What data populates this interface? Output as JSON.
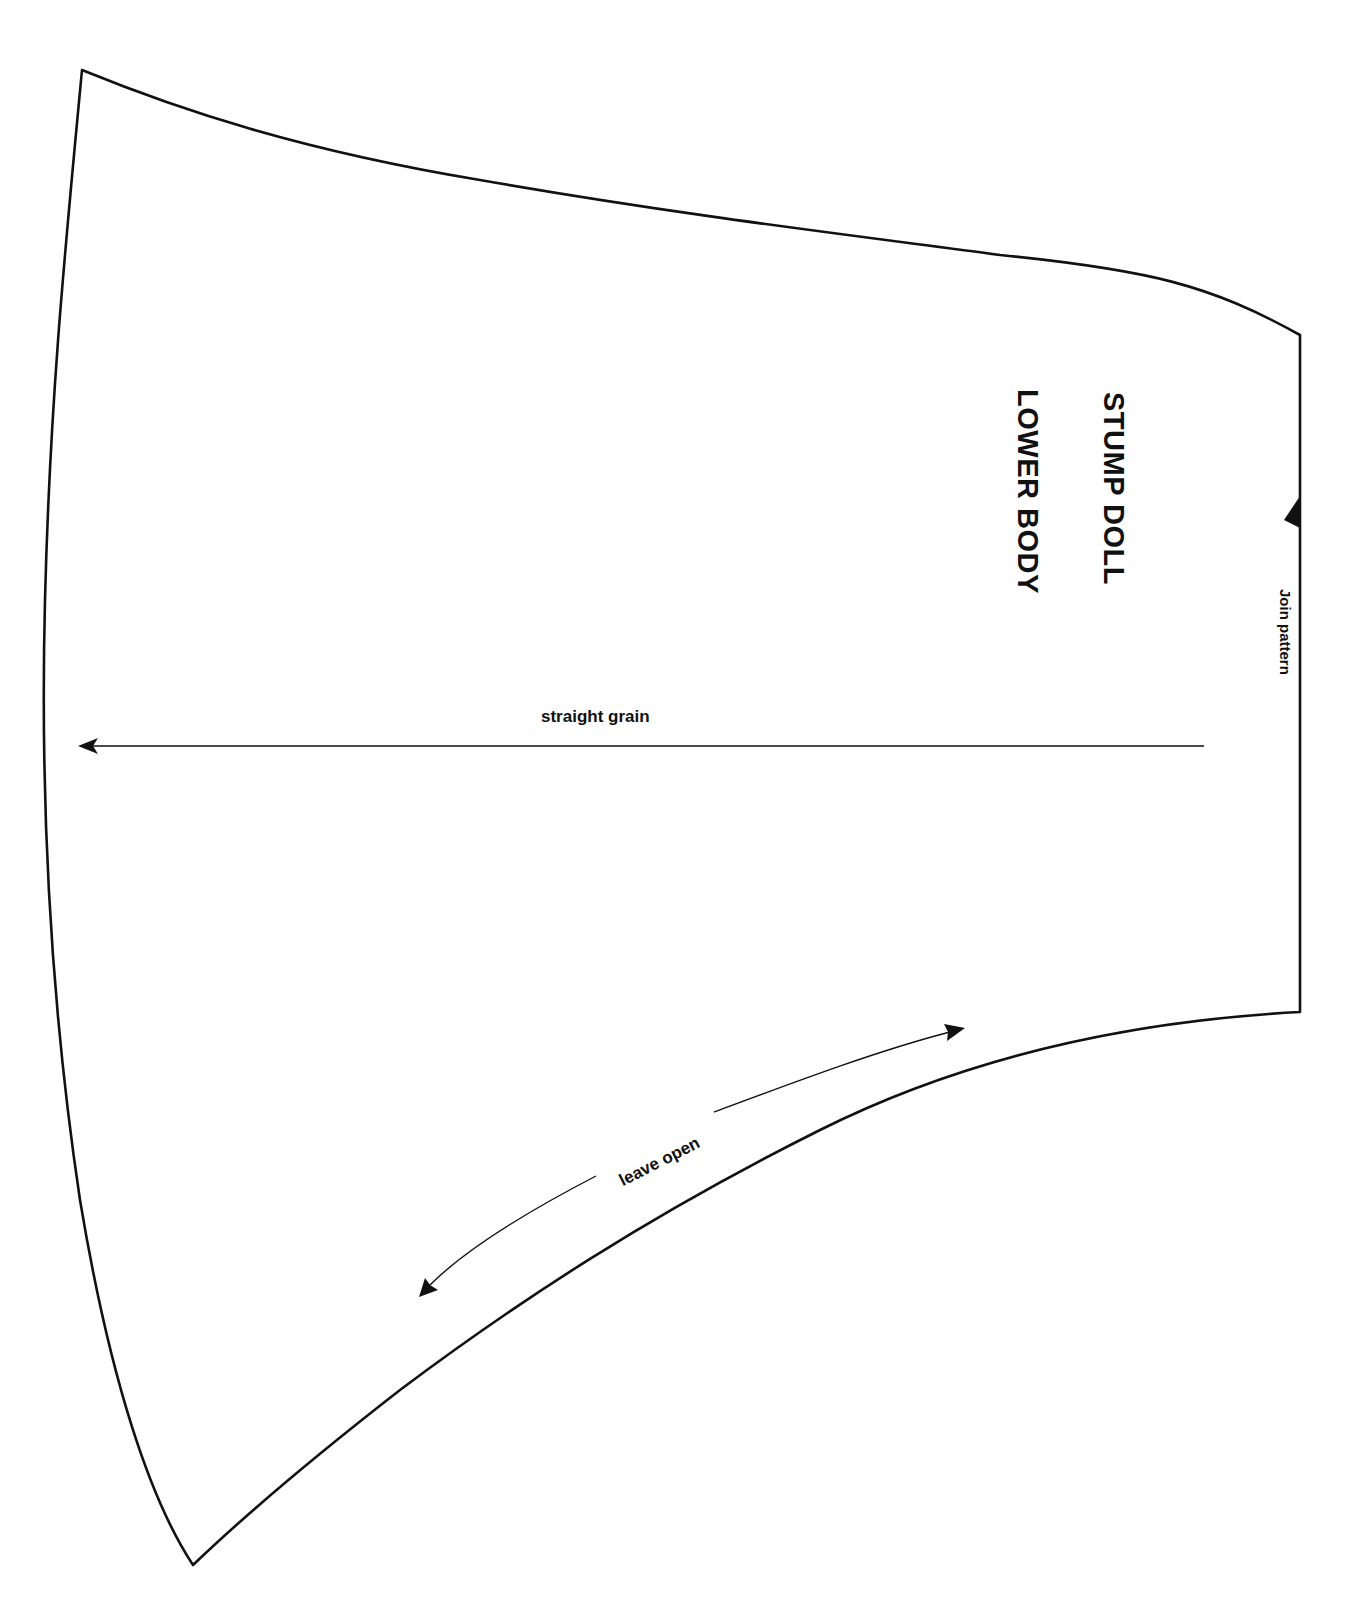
{
  "pattern": {
    "title_line1": "STUMP DOLL",
    "title_line2": "LOWER BODY",
    "join_label": "Join pattern",
    "grain_label": "straight grain",
    "opening_label": "leave open",
    "outline_color": "#111111",
    "background_color": "#ffffff"
  }
}
